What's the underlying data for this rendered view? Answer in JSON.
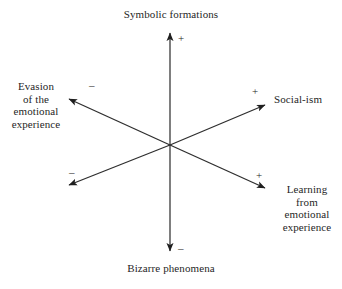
{
  "diagram": {
    "type": "six-axis-polarity-diagram",
    "background_color": "#ffffff",
    "line_color": "#1f1f1f",
    "center": {
      "x": 170,
      "y": 145
    },
    "axes": [
      {
        "name": "vertical",
        "positive_end": {
          "label": "Symbolic formations",
          "sign": "+",
          "direction": "up",
          "tip": {
            "x": 170,
            "y": 30
          }
        },
        "negative_end": {
          "label": "Bizarre phenomena",
          "sign": "–",
          "direction": "down",
          "tip": {
            "x": 170,
            "y": 254
          }
        }
      },
      {
        "name": "diagonal-rising",
        "positive_end": {
          "label": "Social-ism",
          "sign": "+",
          "direction": "up-right",
          "tip": {
            "x": 268,
            "y": 103
          }
        },
        "negative_end": {
          "label": "",
          "sign": "–",
          "direction": "down-left",
          "tip": {
            "x": 66,
            "y": 187
          }
        }
      },
      {
        "name": "diagonal-falling",
        "positive_end": {
          "label": "Learning\nfrom\nemotional\nexperience",
          "sign": "+",
          "direction": "down-right",
          "tip": {
            "x": 268,
            "y": 190
          }
        },
        "negative_end": {
          "label": "Evasion\nof the\nemotional\nexperience",
          "sign": "–",
          "direction": "up-left",
          "tip": {
            "x": 66,
            "y": 97
          }
        }
      }
    ],
    "labels": {
      "top": "Symbolic formations",
      "bottom": "Bizarre phenomena",
      "left": "Evasion\nof the\nemotional\nexperience",
      "right": "Social-ism",
      "lower_right": "Learning\nfrom\nemotional\nexperience"
    },
    "signs": {
      "top": "+",
      "bottom": "–",
      "upper_left": "–",
      "upper_right": "+",
      "lower_left": "–",
      "lower_right": "+"
    }
  }
}
